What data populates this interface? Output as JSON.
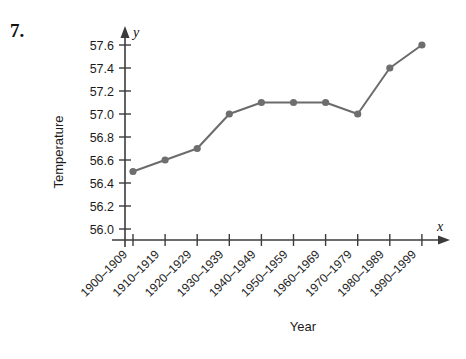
{
  "problem": {
    "number": "7."
  },
  "chart_data": {
    "type": "line",
    "title": "",
    "xlabel": "Year",
    "ylabel": "Temperature",
    "x_axis_variable": "x",
    "y_axis_variable": "y",
    "grid": false,
    "legend": null,
    "categories": [
      "1900–1909",
      "1910–1919",
      "1920–1929",
      "1930–1939",
      "1940–1949",
      "1950–1959",
      "1960–1969",
      "1970–1979",
      "1980–1989",
      "1990–1999"
    ],
    "values": [
      56.5,
      56.6,
      56.7,
      57.0,
      57.1,
      57.1,
      57.1,
      57.0,
      57.4,
      57.6
    ],
    "ylim": [
      55.9,
      57.7
    ],
    "yticks": [
      "56.0",
      "56.2",
      "56.4",
      "56.6",
      "56.8",
      "57.0",
      "57.2",
      "57.4",
      "57.6"
    ],
    "ytick_values": [
      56.0,
      56.2,
      56.4,
      56.6,
      56.8,
      57.0,
      57.2,
      57.4,
      57.6
    ],
    "colors": {
      "line": "#6b6b6b",
      "marker": "#6e6e6e",
      "axis": "#3b3b3b",
      "text": "#1b1b1b",
      "background": "#ffffff"
    }
  }
}
